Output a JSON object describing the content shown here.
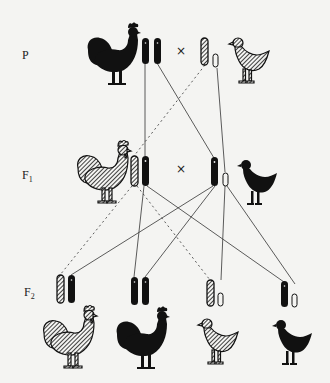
{
  "generations": [
    {
      "id": "P",
      "label": "P",
      "sub": ""
    },
    {
      "id": "F1",
      "label": "F",
      "sub": "1"
    },
    {
      "id": "F2",
      "label": "F",
      "sub": "2"
    }
  ],
  "cross_symbol": "×",
  "colors": {
    "background": "#f4f4f2",
    "ink": "#111111",
    "line": "#333333"
  },
  "legend_semantics": {
    "black-chromosome": "Z chromosome carrying non-barred (black) allele",
    "striped-chromosome": "Z chromosome carrying barred allele",
    "open-chromosome": "W chromosome"
  },
  "individuals": {
    "P": [
      {
        "sex": "male",
        "phenotype": "black",
        "chromosomes": [
          "black",
          "black"
        ]
      },
      {
        "sex": "female",
        "phenotype": "barred",
        "chromosomes": [
          "striped",
          "open"
        ]
      }
    ],
    "F1": [
      {
        "sex": "male",
        "phenotype": "barred",
        "chromosomes": [
          "striped",
          "black"
        ]
      },
      {
        "sex": "female",
        "phenotype": "black",
        "chromosomes": [
          "black",
          "open"
        ]
      }
    ],
    "F2": [
      {
        "sex": "male",
        "phenotype": "barred",
        "chromosomes": [
          "striped",
          "black"
        ]
      },
      {
        "sex": "male",
        "phenotype": "black",
        "chromosomes": [
          "black",
          "black"
        ]
      },
      {
        "sex": "female",
        "phenotype": "barred",
        "chromosomes": [
          "striped",
          "open"
        ]
      },
      {
        "sex": "female",
        "phenotype": "black",
        "chromosomes": [
          "black",
          "open"
        ]
      }
    ]
  }
}
